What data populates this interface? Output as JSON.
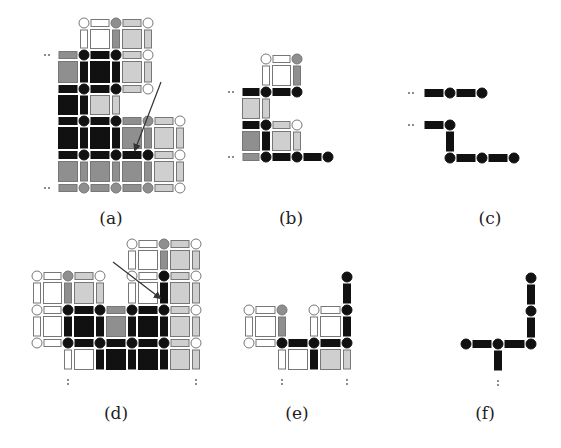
{
  "colors": {
    "black": "#111111",
    "medium": "#8f8f8f",
    "light": "#cfcfcf",
    "white": "#ffffff",
    "stroke": "#777777",
    "arrow": "#333333",
    "label": "#222222"
  },
  "geometry": {
    "node_r": 5,
    "bar_w": 7,
    "gap": 4
  },
  "panels": [
    {
      "id": "a",
      "label": "(a)",
      "label_pos": [
        111,
        222
      ],
      "cols": [
        52,
        84,
        116,
        148,
        180
      ],
      "rows": [
        23,
        55,
        89,
        121,
        155,
        188
      ],
      "dots": [
        [
          48,
          55,
          "h"
        ],
        [
          48,
          188,
          "h"
        ]
      ],
      "nodes": [
        [
          1,
          0,
          "white"
        ],
        [
          2,
          0,
          "medium"
        ],
        [
          3,
          0,
          "white"
        ],
        [
          1,
          1,
          "black"
        ],
        [
          2,
          1,
          "black"
        ],
        [
          3,
          1,
          "white"
        ],
        [
          1,
          2,
          "black"
        ],
        [
          2,
          2,
          "black"
        ],
        [
          3,
          2,
          "white"
        ],
        [
          1,
          3,
          "black"
        ],
        [
          2,
          3,
          "black"
        ],
        [
          3,
          3,
          "medium"
        ],
        [
          4,
          3,
          "white"
        ],
        [
          1,
          4,
          "black"
        ],
        [
          2,
          4,
          "black"
        ],
        [
          3,
          4,
          "black"
        ],
        [
          4,
          4,
          "white"
        ],
        [
          1,
          5,
          "medium"
        ],
        [
          2,
          5,
          "medium"
        ],
        [
          3,
          5,
          "medium"
        ],
        [
          4,
          5,
          "white"
        ]
      ],
      "hbars": [
        [
          1,
          0,
          "white"
        ],
        [
          2,
          0,
          "light"
        ],
        [
          0,
          1,
          "medium"
        ],
        [
          1,
          1,
          "black"
        ],
        [
          2,
          1,
          "light"
        ],
        [
          0,
          2,
          "black"
        ],
        [
          1,
          2,
          "black"
        ],
        [
          2,
          2,
          "light"
        ],
        [
          0,
          3,
          "black"
        ],
        [
          1,
          3,
          "black"
        ],
        [
          2,
          3,
          "medium"
        ],
        [
          3,
          3,
          "light"
        ],
        [
          0,
          4,
          "black"
        ],
        [
          1,
          4,
          "black"
        ],
        [
          2,
          4,
          "black"
        ],
        [
          3,
          4,
          "light"
        ],
        [
          0,
          5,
          "medium"
        ],
        [
          1,
          5,
          "medium"
        ],
        [
          2,
          5,
          "medium"
        ],
        [
          3,
          5,
          "light"
        ]
      ],
      "vbars": [
        [
          1,
          0,
          "white"
        ],
        [
          2,
          0,
          "medium"
        ],
        [
          3,
          0,
          "light"
        ],
        [
          1,
          1,
          "black"
        ],
        [
          2,
          1,
          "black"
        ],
        [
          3,
          1,
          "light"
        ],
        [
          1,
          2,
          "black"
        ],
        [
          2,
          2,
          "light"
        ],
        [
          1,
          3,
          "black"
        ],
        [
          2,
          3,
          "black"
        ],
        [
          3,
          3,
          "medium"
        ],
        [
          4,
          3,
          "light"
        ],
        [
          1,
          4,
          "medium"
        ],
        [
          2,
          4,
          "medium"
        ],
        [
          3,
          4,
          "medium"
        ],
        [
          4,
          4,
          "light"
        ]
      ],
      "squares": [
        [
          1,
          0,
          "white"
        ],
        [
          2,
          0,
          "light"
        ],
        [
          0,
          1,
          "medium"
        ],
        [
          1,
          1,
          "black"
        ],
        [
          2,
          1,
          "light"
        ],
        [
          0,
          2,
          "black"
        ],
        [
          1,
          2,
          "light"
        ],
        [
          0,
          3,
          "black"
        ],
        [
          1,
          3,
          "black"
        ],
        [
          2,
          3,
          "medium"
        ],
        [
          3,
          3,
          "light"
        ],
        [
          0,
          4,
          "medium"
        ],
        [
          1,
          4,
          "medium"
        ],
        [
          2,
          4,
          "medium"
        ],
        [
          3,
          4,
          "light"
        ]
      ],
      "arrow": [
        161,
        82,
        135,
        150
      ]
    },
    {
      "id": "b",
      "label": "(b)",
      "label_pos": [
        291,
        222
      ],
      "cols": [
        236,
        266,
        297,
        328
      ],
      "rows": [
        59,
        92,
        125,
        157
      ],
      "dots": [
        [
          232,
          92,
          "h"
        ],
        [
          232,
          157,
          "h"
        ]
      ],
      "nodes": [
        [
          1,
          0,
          "white"
        ],
        [
          2,
          0,
          "medium"
        ],
        [
          1,
          1,
          "black"
        ],
        [
          2,
          1,
          "black"
        ],
        [
          1,
          2,
          "black"
        ],
        [
          2,
          2,
          "white"
        ],
        [
          1,
          3,
          "black"
        ],
        [
          2,
          3,
          "black"
        ],
        [
          3,
          3,
          "black"
        ]
      ],
      "hbars": [
        [
          1,
          0,
          "white"
        ],
        [
          0,
          1,
          "black"
        ],
        [
          1,
          1,
          "black"
        ],
        [
          0,
          2,
          "black"
        ],
        [
          1,
          2,
          "light"
        ],
        [
          0,
          3,
          "medium"
        ],
        [
          1,
          3,
          "black"
        ],
        [
          2,
          3,
          "black"
        ]
      ],
      "vbars": [
        [
          1,
          0,
          "white"
        ],
        [
          2,
          0,
          "medium"
        ],
        [
          1,
          1,
          "light"
        ],
        [
          1,
          2,
          "black"
        ],
        [
          2,
          2,
          "light"
        ]
      ],
      "squares": [
        [
          1,
          0,
          "white"
        ],
        [
          0,
          1,
          "light"
        ],
        [
          0,
          2,
          "medium"
        ],
        [
          1,
          2,
          "light"
        ]
      ],
      "arrow": null
    },
    {
      "id": "c",
      "label": "(c)",
      "label_pos": [
        490,
        222
      ],
      "cols": [
        418,
        450,
        482,
        514
      ],
      "rows": [
        93,
        125,
        158
      ],
      "dots": [
        [
          412,
          93,
          "h"
        ],
        [
          412,
          125,
          "h"
        ]
      ],
      "nodes": [
        [
          1,
          0,
          "black"
        ],
        [
          2,
          0,
          "black"
        ],
        [
          1,
          1,
          "black"
        ],
        [
          1,
          2,
          "black"
        ],
        [
          2,
          2,
          "black"
        ],
        [
          3,
          2,
          "black"
        ]
      ],
      "hbars": [
        [
          0,
          0,
          "black"
        ],
        [
          1,
          0,
          "black"
        ],
        [
          0,
          1,
          "black"
        ],
        [
          1,
          2,
          "black"
        ],
        [
          2,
          2,
          "black"
        ]
      ],
      "vbars": [
        [
          1,
          1,
          "black"
        ]
      ],
      "squares": [],
      "arrow": null
    },
    {
      "id": "d",
      "label": "(d)",
      "label_pos": [
        116,
        417
      ],
      "cols": [
        37,
        68,
        100,
        132,
        164,
        196
      ],
      "rows": [
        244,
        276,
        310,
        343,
        376
      ],
      "dots": [
        [
          68,
          382,
          "v"
        ],
        [
          196,
          382,
          "v"
        ]
      ],
      "nodes": [
        [
          3,
          0,
          "white"
        ],
        [
          4,
          0,
          "medium"
        ],
        [
          5,
          0,
          "white"
        ],
        [
          0,
          1,
          "white"
        ],
        [
          1,
          1,
          "medium"
        ],
        [
          2,
          1,
          "white"
        ],
        [
          3,
          1,
          "white"
        ],
        [
          4,
          1,
          "black"
        ],
        [
          5,
          1,
          "white"
        ],
        [
          0,
          2,
          "white"
        ],
        [
          1,
          2,
          "black"
        ],
        [
          2,
          2,
          "black"
        ],
        [
          3,
          2,
          "black"
        ],
        [
          4,
          2,
          "black"
        ],
        [
          5,
          2,
          "white"
        ],
        [
          0,
          3,
          "white"
        ],
        [
          1,
          3,
          "black"
        ],
        [
          2,
          3,
          "black"
        ],
        [
          3,
          3,
          "black"
        ],
        [
          4,
          3,
          "black"
        ],
        [
          5,
          3,
          "white"
        ]
      ],
      "hbars": [
        [
          3,
          0,
          "white"
        ],
        [
          4,
          0,
          "light"
        ],
        [
          0,
          1,
          "white"
        ],
        [
          1,
          1,
          "light"
        ],
        [
          3,
          1,
          "white"
        ],
        [
          4,
          1,
          "light"
        ],
        [
          0,
          2,
          "white"
        ],
        [
          1,
          2,
          "black"
        ],
        [
          2,
          2,
          "medium"
        ],
        [
          3,
          2,
          "black"
        ],
        [
          4,
          2,
          "light"
        ],
        [
          0,
          3,
          "white"
        ],
        [
          1,
          3,
          "black"
        ],
        [
          2,
          3,
          "black"
        ],
        [
          3,
          3,
          "black"
        ],
        [
          4,
          3,
          "light"
        ]
      ],
      "vbars": [
        [
          3,
          0,
          "white"
        ],
        [
          4,
          0,
          "medium"
        ],
        [
          5,
          0,
          "light"
        ],
        [
          0,
          1,
          "white"
        ],
        [
          1,
          1,
          "medium"
        ],
        [
          2,
          1,
          "light"
        ],
        [
          3,
          1,
          "white"
        ],
        [
          4,
          1,
          "black"
        ],
        [
          5,
          1,
          "light"
        ],
        [
          0,
          2,
          "white"
        ],
        [
          1,
          2,
          "black"
        ],
        [
          2,
          2,
          "black"
        ],
        [
          3,
          2,
          "black"
        ],
        [
          4,
          2,
          "black"
        ],
        [
          5,
          2,
          "light"
        ],
        [
          1,
          3,
          "white"
        ],
        [
          2,
          3,
          "black"
        ],
        [
          3,
          3,
          "black"
        ],
        [
          4,
          3,
          "black"
        ],
        [
          5,
          3,
          "light"
        ]
      ],
      "squares": [
        [
          3,
          0,
          "white"
        ],
        [
          4,
          0,
          "light"
        ],
        [
          0,
          1,
          "white"
        ],
        [
          1,
          1,
          "light"
        ],
        [
          3,
          1,
          "white"
        ],
        [
          4,
          1,
          "light"
        ],
        [
          0,
          2,
          "white"
        ],
        [
          1,
          2,
          "black"
        ],
        [
          2,
          2,
          "medium"
        ],
        [
          3,
          2,
          "black"
        ],
        [
          4,
          2,
          "light"
        ],
        [
          1,
          3,
          "white"
        ],
        [
          2,
          3,
          "black"
        ],
        [
          3,
          3,
          "black"
        ],
        [
          4,
          3,
          "light"
        ]
      ],
      "arrow": [
        113,
        262,
        160,
        298
      ]
    },
    {
      "id": "e",
      "label": "(e)",
      "label_pos": [
        297,
        417
      ],
      "cols": [
        249,
        282,
        314,
        347
      ],
      "rows": [
        277,
        310,
        343,
        376
      ],
      "dots": [
        [
          282,
          382,
          "v"
        ],
        [
          347,
          382,
          "v"
        ]
      ],
      "nodes": [
        [
          3,
          0,
          "black"
        ],
        [
          0,
          1,
          "white"
        ],
        [
          1,
          1,
          "medium"
        ],
        [
          2,
          1,
          "white"
        ],
        [
          3,
          1,
          "black"
        ],
        [
          0,
          2,
          "white"
        ],
        [
          1,
          2,
          "black"
        ],
        [
          2,
          2,
          "black"
        ],
        [
          3,
          2,
          "black"
        ]
      ],
      "hbars": [
        [
          0,
          1,
          "white"
        ],
        [
          2,
          1,
          "white"
        ],
        [
          0,
          2,
          "white"
        ],
        [
          1,
          2,
          "black"
        ],
        [
          2,
          2,
          "black"
        ]
      ],
      "vbars": [
        [
          3,
          0,
          "black"
        ],
        [
          0,
          1,
          "white"
        ],
        [
          1,
          1,
          "medium"
        ],
        [
          2,
          1,
          "white"
        ],
        [
          3,
          1,
          "black"
        ],
        [
          1,
          2,
          "white"
        ],
        [
          2,
          2,
          "black"
        ],
        [
          3,
          2,
          "light"
        ]
      ],
      "squares": [
        [
          0,
          1,
          "white"
        ],
        [
          2,
          1,
          "white"
        ],
        [
          1,
          2,
          "white"
        ],
        [
          2,
          2,
          "light"
        ]
      ],
      "arrow": null
    },
    {
      "id": "f",
      "label": "(f)",
      "label_pos": [
        485,
        417
      ],
      "cols": [
        466,
        498,
        531
      ],
      "rows": [
        278,
        311,
        344,
        377
      ],
      "dots": [
        [
          498,
          383,
          "v"
        ]
      ],
      "nodes": [
        [
          2,
          0,
          "black"
        ],
        [
          2,
          1,
          "black"
        ],
        [
          0,
          2,
          "black"
        ],
        [
          1,
          2,
          "black"
        ],
        [
          2,
          2,
          "black"
        ]
      ],
      "hbars": [
        [
          0,
          2,
          "black"
        ],
        [
          1,
          2,
          "black"
        ]
      ],
      "vbars": [
        [
          2,
          0,
          "black"
        ],
        [
          2,
          1,
          "black"
        ],
        [
          1,
          2,
          "black"
        ]
      ],
      "squares": [],
      "arrow": null
    }
  ]
}
